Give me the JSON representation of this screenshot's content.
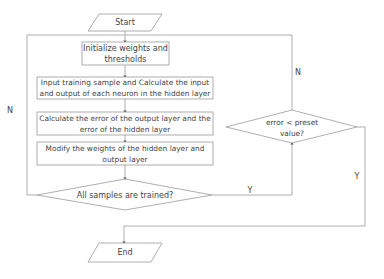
{
  "diagram": {
    "type": "flowchart",
    "colors": {
      "stroke": "#9a9a9a",
      "text": "#444444",
      "background": "#ffffff"
    },
    "nodes": {
      "start": {
        "shape": "parallelogram",
        "label": "Start"
      },
      "init": {
        "shape": "process",
        "label_line1": "Initialize weights and",
        "label_line2": "thresholds"
      },
      "input": {
        "shape": "process",
        "label_line1": "Input training sample and Calculate the input",
        "label_line2": "and output of each neuron in the hidden layer"
      },
      "calc_error": {
        "shape": "process",
        "label_line1": "Calculate the error of the output layer and the",
        "label_line2": "error of the hidden layer"
      },
      "modify": {
        "shape": "process",
        "label_line1": "Modify the weights of the hidden layer and",
        "label_line2": "output layer"
      },
      "all_trained": {
        "shape": "decision",
        "label": "All samples are trained?"
      },
      "error_check": {
        "shape": "decision",
        "label_line1": "error < preset",
        "label_line2": "value?"
      },
      "end": {
        "shape": "parallelogram",
        "label": "End"
      }
    },
    "edge_labels": {
      "all_trained_no": "N",
      "all_trained_yes": "Y",
      "error_no": "N",
      "error_yes": "Y"
    }
  }
}
